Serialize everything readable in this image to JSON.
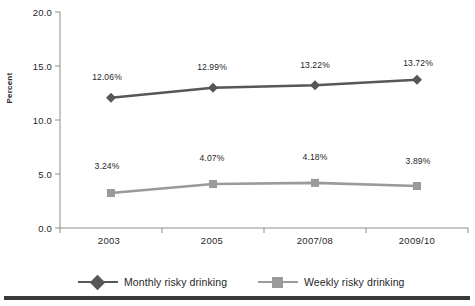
{
  "chart_data": {
    "type": "line",
    "title": "",
    "subtitle": "",
    "xlabel": "",
    "ylabel": "Percent",
    "categories": [
      "2003",
      "2005",
      "2007/08",
      "2009/10"
    ],
    "ylim": [
      0.0,
      20.0
    ],
    "yticks": [
      "0.0",
      "5.0",
      "10.0",
      "15.0",
      "20.0"
    ],
    "ytick_values": [
      0.0,
      5.0,
      10.0,
      15.0,
      20.0
    ],
    "grid": false,
    "legend_position": "bottom",
    "series": [
      {
        "name": "Monthly risky drinking",
        "marker": "diamond",
        "color": "#575757",
        "values": [
          12.06,
          12.99,
          13.22,
          13.72
        ],
        "labels": [
          "12.06%",
          "12.99%",
          "13.22%",
          "13.72%"
        ]
      },
      {
        "name": "Weekly risky drinking",
        "marker": "square",
        "color": "#9a9a9a",
        "values": [
          3.24,
          4.07,
          4.18,
          3.89
        ],
        "labels": [
          "3.24%",
          "4.07%",
          "4.18%",
          "3.89%"
        ]
      }
    ]
  },
  "axis": {
    "y_title": "Percent",
    "tick_labels_y": [
      "20.0",
      "15.0",
      "10.0",
      "5.0",
      "0.0"
    ],
    "tick_labels_x": [
      "2003",
      "2005",
      "2007/08",
      "2009/10"
    ]
  },
  "legend": {
    "items": [
      {
        "label": "Monthly risky drinking",
        "color": "#575757",
        "marker": "diamond-marker"
      },
      {
        "label": "Weekly risky drinking",
        "color": "#9a9a9a",
        "marker": "square-marker"
      }
    ]
  },
  "colors": {
    "series_monthly": "#575757",
    "series_weekly": "#9a9a9a",
    "axis": "#8d8d8d",
    "text": "#1f1f1f",
    "bottom_rule": "#3a3a3a"
  }
}
